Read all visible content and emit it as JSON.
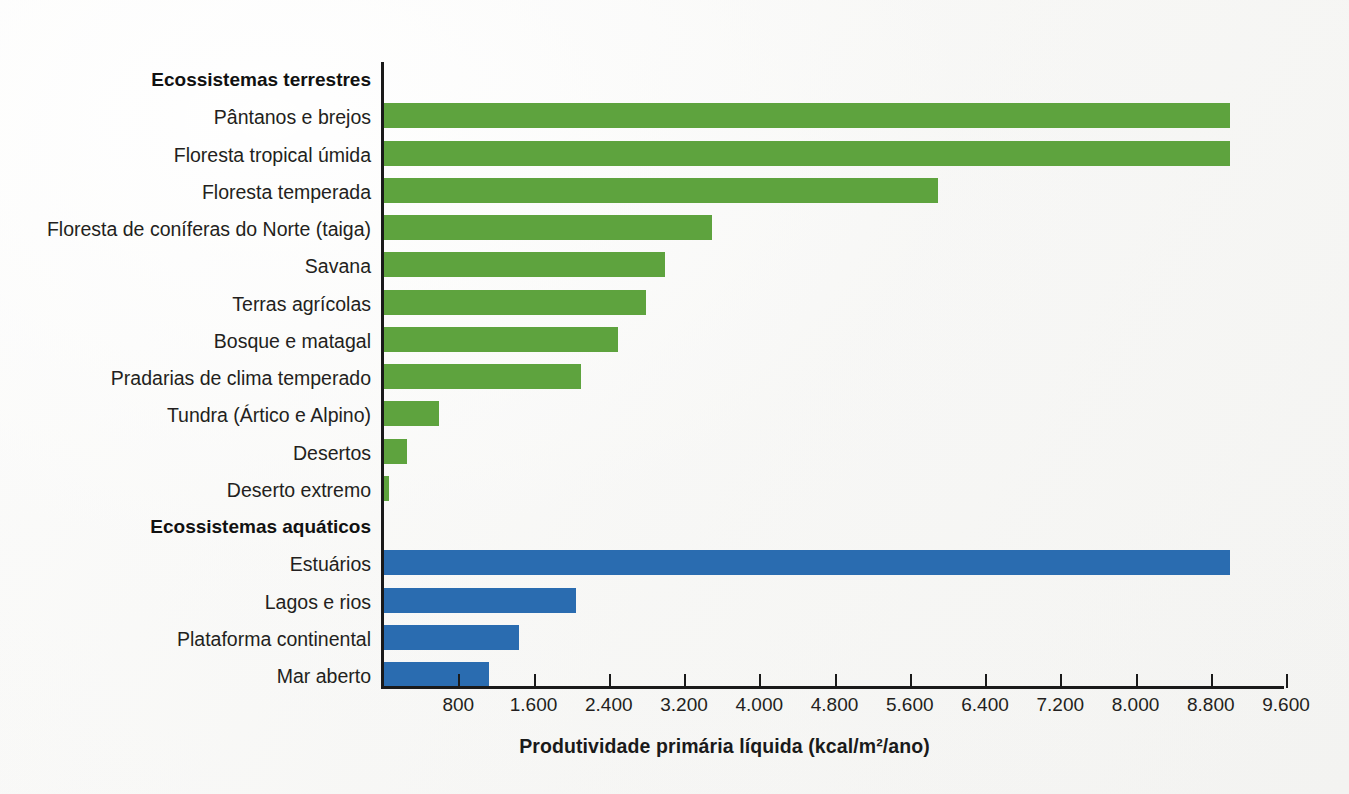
{
  "chart_data": {
    "type": "bar",
    "orientation": "horizontal",
    "title": "",
    "xlabel": "Produtividade primária líquida (kcal/m²/ano)",
    "ylabel": "",
    "xlim": [
      0,
      9600
    ],
    "grid": false,
    "legend": "none",
    "xticks": [
      800,
      1600,
      2400,
      3200,
      4000,
      4800,
      5600,
      6400,
      7200,
      8000,
      8800,
      9600
    ],
    "xtick_labels": [
      "800",
      "1.600",
      "2.400",
      "3.200",
      "4.000",
      "4.800",
      "5.600",
      "6.400",
      "7.200",
      "8.000",
      "8.800",
      "9.600"
    ],
    "groups": [
      {
        "name": "Ecossistemas terrestres",
        "color": "#5ea33e",
        "categories": [
          "Pântanos e brejos",
          "Floresta tropical úmida",
          "Floresta temperada",
          "Floresta de coníferas do Norte (taiga)",
          "Savana",
          "Terras agrícolas",
          "Bosque e matagal",
          "Pradarias de clima temperado",
          "Tundra (Ártico e Alpino)",
          "Desertos",
          "Deserto extremo"
        ],
        "values": [
          9000,
          9000,
          5900,
          3500,
          3000,
          2800,
          2500,
          2100,
          600,
          250,
          60
        ]
      },
      {
        "name": "Ecossistemas aquáticos",
        "color": "#2a6cb0",
        "categories": [
          "Estuários",
          "Lagos e rios",
          "Plataforma continental",
          "Mar aberto"
        ],
        "values": [
          9000,
          2050,
          1450,
          1130
        ]
      }
    ]
  },
  "colors": {
    "terrestrial_bar": "#5ea33e",
    "aquatic_bar": "#2a6cb0",
    "axis": "#1a1a1a",
    "text": "#231f20",
    "background": "#fbfbfa"
  },
  "rows": [
    {
      "kind": "group",
      "label": "Ecossistemas terrestres"
    },
    {
      "kind": "bar",
      "label": "Pântanos e brejos",
      "value": 9000,
      "series": "terrestrial"
    },
    {
      "kind": "bar",
      "label": "Floresta tropical úmida",
      "value": 9000,
      "series": "terrestrial"
    },
    {
      "kind": "bar",
      "label": "Floresta temperada",
      "value": 5900,
      "series": "terrestrial"
    },
    {
      "kind": "bar",
      "label": "Floresta de coníferas do Norte (taiga)",
      "value": 3500,
      "series": "terrestrial"
    },
    {
      "kind": "bar",
      "label": "Savana",
      "value": 3000,
      "series": "terrestrial"
    },
    {
      "kind": "bar",
      "label": "Terras agrícolas",
      "value": 2800,
      "series": "terrestrial"
    },
    {
      "kind": "bar",
      "label": "Bosque e matagal",
      "value": 2500,
      "series": "terrestrial"
    },
    {
      "kind": "bar",
      "label": "Pradarias de clima temperado",
      "value": 2100,
      "series": "terrestrial"
    },
    {
      "kind": "bar",
      "label": "Tundra (Ártico e Alpino)",
      "value": 600,
      "series": "terrestrial"
    },
    {
      "kind": "bar",
      "label": "Desertos",
      "value": 250,
      "series": "terrestrial"
    },
    {
      "kind": "bar",
      "label": "Deserto extremo",
      "value": 60,
      "series": "terrestrial"
    },
    {
      "kind": "group",
      "label": "Ecossistemas aquáticos"
    },
    {
      "kind": "bar",
      "label": "Estuários",
      "value": 9000,
      "series": "aquatic"
    },
    {
      "kind": "bar",
      "label": "Lagos e rios",
      "value": 2050,
      "series": "aquatic"
    },
    {
      "kind": "bar",
      "label": "Plataforma continental",
      "value": 1450,
      "series": "aquatic"
    },
    {
      "kind": "bar",
      "label": "Mar aberto",
      "value": 1130,
      "series": "aquatic"
    }
  ]
}
